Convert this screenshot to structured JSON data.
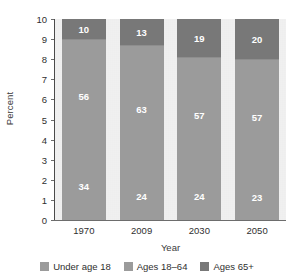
{
  "chart_data": {
    "type": "bar",
    "subtype": "stacked-bar-100-percent",
    "title": "",
    "subtitle": "",
    "xlabel": "Year",
    "ylabel": "Percent",
    "categories": [
      "1970",
      "2009",
      "2030",
      "2050"
    ],
    "xtick_labels": [
      "1970",
      "2009",
      "2030",
      "2050"
    ],
    "ytick_labels": [
      "0",
      "1",
      "2",
      "3",
      "4",
      "5",
      "6",
      "7",
      "8",
      "9",
      "10"
    ],
    "ylim": [
      0,
      10
    ],
    "ytick_step": 1,
    "grid": false,
    "legend_position": "bottom",
    "value_note": "Axis shows tens of percent; segment labels are percentages summing to 100 per year.",
    "series": [
      {
        "name": "Under age 18",
        "color": "#9b9b9b",
        "values": [
          34,
          24,
          24,
          23
        ],
        "value_labels": [
          "34",
          "24",
          "24",
          "23"
        ]
      },
      {
        "name": "Ages 18–64",
        "color": "#9b9b9b",
        "values": [
          56,
          63,
          57,
          57
        ],
        "value_labels": [
          "56",
          "63",
          "57",
          "57"
        ]
      },
      {
        "name": "Ages 65+",
        "color": "#787878",
        "values": [
          10,
          13,
          19,
          20
        ],
        "value_labels": [
          "10",
          "13",
          "19",
          "20"
        ]
      }
    ],
    "legend": [
      {
        "label": "Under age 18",
        "color": "#9b9b9b"
      },
      {
        "label": "Ages 18–64",
        "color": "#9b9b9b"
      },
      {
        "label": "Ages 65+",
        "color": "#787878"
      }
    ],
    "colors": {
      "plot_background": "#eeeeee",
      "page_background": "#ffffff",
      "axis": "#4a4a4a",
      "text": "#2f2f2f",
      "value_label": "#ffffff"
    }
  }
}
